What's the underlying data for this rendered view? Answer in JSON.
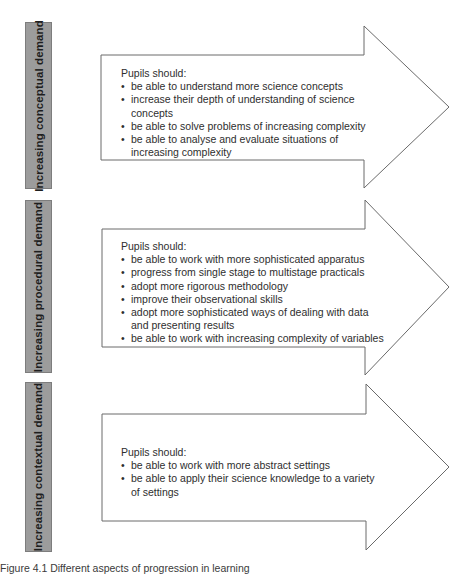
{
  "diagram": {
    "sections": [
      {
        "id": "conceptual",
        "label": "Increasing conceptual demand",
        "heading": "Pupils should:",
        "items": [
          "be able to understand more science concepts",
          "increase their depth of understanding of science concepts",
          "be able to solve problems of increasing complexity",
          "be able to analyse and evaluate situations of increasing complexity"
        ]
      },
      {
        "id": "procedural",
        "label": "Increasing procedural demand",
        "heading": "Pupils should:",
        "items": [
          "be able to work with more sophisticated apparatus",
          "progress from single stage to multistage practicals",
          "adopt more rigorous methodology",
          "improve their observational skills",
          "adopt more sophisticated ways of dealing with data and presenting results",
          "be able to work with increasing complexity of variables"
        ]
      },
      {
        "id": "contextual",
        "label": "Increasing contextual demand",
        "heading": "Pupils should:",
        "items": [
          "be able to work with more abstract settings",
          "be able to apply their science knowledge to a variety of settings"
        ]
      }
    ],
    "caption": "Figure 4.1  Different aspects of progression in learning",
    "colors": {
      "label_bar_fill": "#9c9c9c",
      "label_bar_border": "#7d7d7d",
      "arrow_stroke": "#6a6a6a",
      "arrow_fill": "#ffffff",
      "text": "#2e2e2e"
    }
  }
}
